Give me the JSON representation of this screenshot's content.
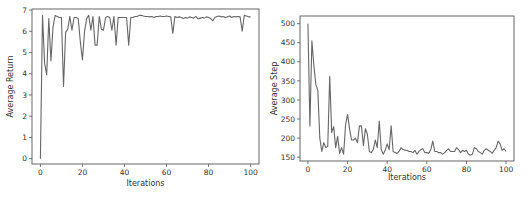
{
  "chart_data": [
    {
      "type": "line",
      "title": "",
      "xlabel": "Iterations",
      "ylabel": "Average Return",
      "xlim": [
        -4,
        104
      ],
      "ylim": [
        -0.25,
        7.05
      ],
      "xticks": [
        0,
        20,
        40,
        60,
        80,
        100
      ],
      "yticks": [
        0,
        1,
        2,
        3,
        4,
        5,
        6,
        7
      ],
      "grid": false,
      "legend": null,
      "line_color": "#666666",
      "x": [
        0,
        1,
        2,
        3,
        4,
        5,
        6,
        7,
        8,
        9,
        10,
        11,
        12,
        13,
        14,
        15,
        16,
        17,
        18,
        19,
        20,
        21,
        22,
        23,
        24,
        25,
        26,
        27,
        28,
        29,
        30,
        31,
        32,
        33,
        34,
        35,
        36,
        37,
        38,
        39,
        40,
        41,
        42,
        43,
        44,
        45,
        46,
        47,
        48,
        49,
        50,
        51,
        52,
        53,
        54,
        55,
        56,
        57,
        58,
        59,
        60,
        61,
        62,
        63,
        64,
        65,
        66,
        67,
        68,
        69,
        70,
        71,
        72,
        73,
        74,
        75,
        76,
        77,
        78,
        79,
        80,
        81,
        82,
        83,
        84,
        85,
        86,
        87,
        88,
        89,
        90,
        91,
        92,
        93,
        94,
        95,
        96,
        97,
        98,
        99,
        100
      ],
      "series": [
        {
          "name": "Average Return",
          "values": [
            0.0,
            6.75,
            4.5,
            3.95,
            6.6,
            4.6,
            6.2,
            6.75,
            6.7,
            6.65,
            6.65,
            3.4,
            5.95,
            6.1,
            6.7,
            6.05,
            6.65,
            6.65,
            6.6,
            5.5,
            4.65,
            6.0,
            6.6,
            6.75,
            6.05,
            6.7,
            5.35,
            5.35,
            6.7,
            6.1,
            6.05,
            6.65,
            6.7,
            6.65,
            6.05,
            6.7,
            5.35,
            6.65,
            6.65,
            6.65,
            6.65,
            6.65,
            5.35,
            6.65,
            6.65,
            6.7,
            6.7,
            6.75,
            6.75,
            6.72,
            6.7,
            6.7,
            6.68,
            6.7,
            6.65,
            6.7,
            6.7,
            6.72,
            6.7,
            6.7,
            6.72,
            6.7,
            6.68,
            5.9,
            6.7,
            6.65,
            6.68,
            6.65,
            6.6,
            6.65,
            6.62,
            6.68,
            6.65,
            6.62,
            6.7,
            6.58,
            6.62,
            6.65,
            6.62,
            6.68,
            6.65,
            6.6,
            6.5,
            6.65,
            6.7,
            6.72,
            6.68,
            6.7,
            6.65,
            6.68,
            6.72,
            6.65,
            6.7,
            6.68,
            6.7,
            6.68,
            6.0,
            6.75,
            6.72,
            6.68,
            6.68
          ]
        }
      ]
    },
    {
      "type": "line",
      "title": "",
      "xlabel": "Iterations",
      "ylabel": "Average Step",
      "xlim": [
        -4,
        104
      ],
      "ylim": [
        140,
        520
      ],
      "xticks": [
        0,
        20,
        40,
        60,
        80,
        100
      ],
      "yticks": [
        150,
        200,
        250,
        300,
        350,
        400,
        450,
        500
      ],
      "grid": false,
      "legend": null,
      "line_color": "#666666",
      "x": [
        0,
        1,
        2,
        3,
        4,
        5,
        6,
        7,
        8,
        9,
        10,
        11,
        12,
        13,
        14,
        15,
        16,
        17,
        18,
        19,
        20,
        21,
        22,
        23,
        24,
        25,
        26,
        27,
        28,
        29,
        30,
        31,
        32,
        33,
        34,
        35,
        36,
        37,
        38,
        39,
        40,
        41,
        42,
        43,
        44,
        45,
        46,
        47,
        48,
        49,
        50,
        51,
        52,
        53,
        54,
        55,
        56,
        57,
        58,
        59,
        60,
        61,
        62,
        63,
        64,
        65,
        66,
        67,
        68,
        69,
        70,
        71,
        72,
        73,
        74,
        75,
        76,
        77,
        78,
        79,
        80,
        81,
        82,
        83,
        84,
        85,
        86,
        87,
        88,
        89,
        90,
        91,
        92,
        93,
        94,
        95,
        96,
        97,
        98,
        99,
        100
      ],
      "series": [
        {
          "name": "Average Step",
          "values": [
            500,
            232,
            455,
            390,
            340,
            325,
            200,
            165,
            188,
            175,
            178,
            362,
            215,
            230,
            175,
            205,
            160,
            175,
            158,
            235,
            262,
            225,
            195,
            195,
            200,
            188,
            232,
            232,
            180,
            225,
            210,
            165,
            162,
            170,
            195,
            175,
            245,
            170,
            158,
            168,
            185,
            170,
            232,
            165,
            162,
            160,
            165,
            175,
            170,
            168,
            168,
            165,
            165,
            162,
            168,
            158,
            165,
            170,
            172,
            162,
            162,
            160,
            170,
            192,
            165,
            165,
            162,
            162,
            158,
            162,
            168,
            172,
            165,
            165,
            165,
            175,
            170,
            162,
            168,
            165,
            168,
            158,
            155,
            158,
            175,
            172,
            165,
            162,
            158,
            168,
            172,
            168,
            165,
            160,
            168,
            175,
            192,
            185,
            168,
            172,
            165
          ]
        }
      ]
    }
  ]
}
